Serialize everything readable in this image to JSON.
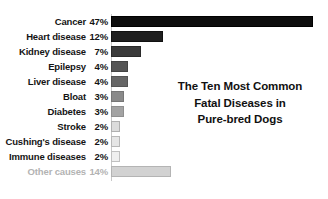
{
  "chart_data": {
    "type": "bar",
    "orientation": "horizontal",
    "title_lines": [
      "The Ten Most Common",
      "Fatal Diseases in",
      "Pure-bred Dogs"
    ],
    "xlabel": "",
    "ylabel": "",
    "xlim": [
      0,
      47
    ],
    "grid": false,
    "legend": false,
    "categories": [
      "Cancer",
      "Heart disease",
      "Kidney disease",
      "Epilepsy",
      "Liver disease",
      "Bloat",
      "Diabetes",
      "Stroke",
      "Cushing's disease",
      "Immune diseases",
      "Other causes"
    ],
    "values": [
      47,
      12,
      7,
      4,
      4,
      3,
      3,
      2,
      2,
      2,
      14
    ],
    "value_labels": [
      "47%",
      "12%",
      "7%",
      "4%",
      "4%",
      "3%",
      "3%",
      "2%",
      "2%",
      "2%",
      "14%"
    ],
    "bars": [
      {
        "label": "Cancer",
        "value": 47,
        "value_label": "47%",
        "color": "#0d0d0d",
        "border": "#000000",
        "muted": false
      },
      {
        "label": "Heart disease",
        "value": 12,
        "value_label": "12%",
        "color": "#1f1f1f",
        "border": "#111111",
        "muted": false
      },
      {
        "label": "Kidney disease",
        "value": 7,
        "value_label": "7%",
        "color": "#3a3a3a",
        "border": "#2a2a2a",
        "muted": false
      },
      {
        "label": "Epilepsy",
        "value": 4,
        "value_label": "4%",
        "color": "#555555",
        "border": "#444444",
        "muted": false
      },
      {
        "label": "Liver disease",
        "value": 4,
        "value_label": "4%",
        "color": "#666666",
        "border": "#555555",
        "muted": false
      },
      {
        "label": "Bloat",
        "value": 3,
        "value_label": "3%",
        "color": "#8a8a8a",
        "border": "#777777",
        "muted": false
      },
      {
        "label": "Diabetes",
        "value": 3,
        "value_label": "3%",
        "color": "#a3a3a3",
        "border": "#8f8f8f",
        "muted": false
      },
      {
        "label": "Stroke",
        "value": 2,
        "value_label": "2%",
        "color": "#dcdcdc",
        "border": "#b0b0b0",
        "muted": false
      },
      {
        "label": "Cushing's disease",
        "value": 2,
        "value_label": "2%",
        "color": "#e6e6e6",
        "border": "#b8b8b8",
        "muted": false
      },
      {
        "label": "Immune diseases",
        "value": 2,
        "value_label": "2%",
        "color": "#efefef",
        "border": "#c0c0c0",
        "muted": false
      },
      {
        "label": "Other causes",
        "value": 14,
        "value_label": "14%",
        "color": "#d2d2d2",
        "border": "#b4b4b4",
        "muted": true
      }
    ],
    "colors": {
      "background": "#ffffff",
      "text": "#141414",
      "muted_text": "#b3b3b3",
      "axis": "#c8c8c8"
    }
  }
}
